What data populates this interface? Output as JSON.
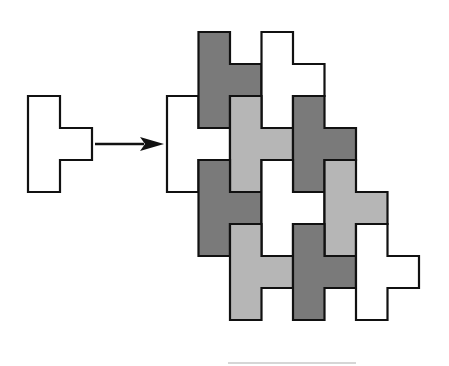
{
  "diagram": {
    "colors": {
      "background": "#ffffff",
      "outline": "#111111",
      "white": "#ffffff",
      "dark": "#7a7a7a",
      "light": "#b6b6b6"
    },
    "source_tile": {
      "shape": "T-tetromino (stem up-down, arm pointing right)",
      "x": 28,
      "y": 96,
      "cell": 32,
      "fill": "white"
    },
    "arrow": {
      "x1": 95,
      "y1": 144,
      "x2": 164,
      "y2": 144,
      "direction": "right"
    },
    "tiling": {
      "cell_w": 31.5,
      "cell_h": 32,
      "origin_x": 167,
      "pieces": [
        {
          "id": "w1",
          "col": 0,
          "y": 96,
          "fill": "white"
        },
        {
          "id": "d1",
          "col": 1,
          "y": 32,
          "fill": "dark"
        },
        {
          "id": "w2",
          "col": 3,
          "y": 32,
          "fill": "white"
        },
        {
          "id": "l1",
          "col": 2,
          "y": 96,
          "fill": "light"
        },
        {
          "id": "d2",
          "col": 4,
          "y": 96,
          "fill": "dark"
        },
        {
          "id": "d3",
          "col": 1,
          "y": 160,
          "fill": "dark"
        },
        {
          "id": "w3",
          "col": 3,
          "y": 160,
          "fill": "white"
        },
        {
          "id": "l2",
          "col": 5,
          "y": 160,
          "fill": "light"
        },
        {
          "id": "l3",
          "col": 2,
          "y": 224,
          "fill": "light"
        },
        {
          "id": "d4",
          "col": 4,
          "y": 224,
          "fill": "dark"
        },
        {
          "id": "w4",
          "col": 6,
          "y": 224,
          "fill": "white"
        }
      ]
    }
  }
}
